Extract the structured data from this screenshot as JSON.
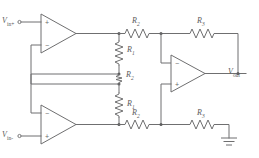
{
  "figure": {
    "type": "circuit-schematic",
    "name": "three-op-amp-instrumentation-amplifier",
    "background_color": "#ffffff",
    "line_color": "#6f6f70",
    "text_color": "#5a5a5b"
  },
  "ports": [
    {
      "id": "vin-plus",
      "symbol": "V",
      "subscript": "in+",
      "position": "top-left",
      "role": "non-inverting input terminal"
    },
    {
      "id": "vin-minus",
      "symbol": "V",
      "subscript": "in-",
      "position": "bottom-left",
      "role": "inverting input terminal"
    },
    {
      "id": "vout",
      "symbol": "V",
      "subscript": "out",
      "position": "right",
      "role": "output terminal"
    }
  ],
  "opamps": [
    {
      "id": "opamp-top",
      "label": "",
      "pin_top": "+",
      "pin_bottom": "−",
      "stage": "input buffer non-inverting"
    },
    {
      "id": "opamp-bottom",
      "label": "",
      "pin_top": "−",
      "pin_bottom": "+",
      "stage": "input buffer inverting"
    },
    {
      "id": "opamp-output",
      "label": "",
      "pin_top": "−",
      "pin_bottom": "+",
      "stage": "difference amplifier"
    }
  ],
  "resistors": [
    {
      "id": "r1-top",
      "symbol": "R",
      "subscript": "1",
      "orientation": "vertical",
      "note": "upper gain resistor in feedback of top op amp"
    },
    {
      "id": "r2-gain",
      "symbol": "R",
      "subscript": "2",
      "orientation": "vertical",
      "note": "central gain setting resistor"
    },
    {
      "id": "r1-bottom",
      "symbol": "R",
      "subscript": "1",
      "orientation": "vertical",
      "note": "lower gain resistor in feedback of bottom op amp"
    },
    {
      "id": "r2-top",
      "symbol": "R",
      "subscript": "2",
      "orientation": "horizontal",
      "note": "top input resistor of difference stage"
    },
    {
      "id": "r3-top",
      "symbol": "R",
      "subscript": "3",
      "orientation": "horizontal",
      "note": "top feedback resistor of difference stage"
    },
    {
      "id": "r2-bottom",
      "symbol": "R",
      "subscript": "2",
      "orientation": "horizontal",
      "note": "bottom input resistor of difference stage"
    },
    {
      "id": "r3-bottom",
      "symbol": "R",
      "subscript": "3",
      "orientation": "horizontal",
      "note": "bottom resistor to ground of difference stage"
    }
  ],
  "ground": {
    "id": "ground-symbol",
    "label": "",
    "position": "bottom-right"
  }
}
